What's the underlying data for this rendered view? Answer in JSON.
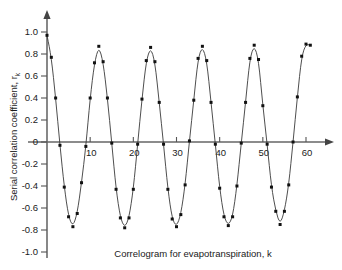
{
  "chart_data": {
    "type": "line",
    "title": "",
    "subtitle": "",
    "xlabel": "Correlogram for evapotranspiration, k",
    "ylabel": "Serial correlation coefficient, r",
    "ylabel_subscript": "k",
    "xlim": [
      0,
      63
    ],
    "ylim": [
      -1.0,
      1.05
    ],
    "grid": false,
    "legend": false,
    "legend_position": "none",
    "x_ticks": [
      10,
      20,
      30,
      40,
      50,
      60
    ],
    "x_tick_labels": [
      "10",
      "20",
      "30",
      "40",
      "50",
      "60"
    ],
    "y_ticks": [
      1.0,
      0.8,
      0.6,
      0.4,
      0.2,
      0,
      -0.2,
      -0.4,
      -0.6,
      -0.8,
      -1.0
    ],
    "y_tick_labels": [
      "1.0",
      "0.8",
      "0.6",
      "0.4",
      "0.2",
      "0",
      "-0.2",
      "-0.4",
      "-0.6",
      "-0.8",
      "-1.0"
    ],
    "marker": "square",
    "line_color": "#3a3a3a",
    "marker_color": "#111111",
    "axis_color": "#555555",
    "series": [
      {
        "name": "r_k",
        "x": [
          0,
          1,
          2,
          3,
          4,
          5,
          6,
          7,
          8,
          9,
          10,
          11,
          12,
          13,
          14,
          15,
          16,
          17,
          18,
          19,
          20,
          21,
          22,
          23,
          24,
          25,
          26,
          27,
          28,
          29,
          30,
          31,
          32,
          33,
          34,
          35,
          36,
          37,
          38,
          39,
          40,
          41,
          42,
          43,
          44,
          45,
          46,
          47,
          48,
          49,
          50,
          51,
          52,
          53,
          54,
          55,
          56,
          57,
          58,
          59,
          60,
          61
        ],
        "values": [
          0.97,
          0.77,
          0.4,
          -0.03,
          -0.41,
          -0.68,
          -0.77,
          -0.65,
          -0.37,
          -0.04,
          0.4,
          0.72,
          0.87,
          0.73,
          0.4,
          -0.01,
          -0.43,
          -0.69,
          -0.78,
          -0.69,
          -0.43,
          -0.02,
          0.39,
          0.74,
          0.86,
          0.73,
          0.36,
          -0.02,
          -0.43,
          -0.7,
          -0.77,
          -0.66,
          -0.39,
          0.01,
          0.38,
          0.76,
          0.87,
          0.74,
          0.36,
          -0.02,
          -0.42,
          -0.68,
          -0.76,
          -0.68,
          -0.4,
          -0.01,
          0.36,
          0.76,
          0.88,
          0.75,
          0.33,
          -0.02,
          -0.41,
          -0.63,
          -0.75,
          -0.63,
          -0.39,
          0.0,
          0.41,
          0.78,
          0.89,
          0.88
        ]
      }
    ]
  }
}
